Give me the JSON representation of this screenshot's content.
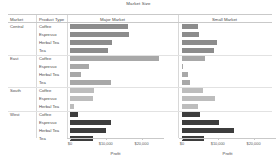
{
  "title": "Market Size",
  "headers": {
    "market": "Market",
    "product_type": "Product Type",
    "panels": [
      "Major Market",
      "Small Market"
    ]
  },
  "axis": {
    "label": "Profit",
    "ticks": [
      "$0",
      "$10,000",
      "$20,000"
    ],
    "tick_values": [
      0,
      10000,
      20000
    ],
    "min": 0,
    "max": 26000
  },
  "colors": {
    "Central": "#8c8c8c",
    "East": "#a8a8a8",
    "South": "#bdbdbd",
    "West": "#3d3d3d",
    "gridline": "#e2e2e2",
    "axis": "#c9c9c9",
    "text": "#4a4a4a"
  },
  "chart_data": {
    "type": "bar",
    "title": "Market Size",
    "xlabel": "Profit",
    "ylabel": "",
    "xlim": [
      0,
      26000
    ],
    "orientation": "horizontal",
    "grid": true,
    "legend_position": "none",
    "panel_columns": [
      "Major Market",
      "Small Market"
    ],
    "row_groups": [
      "Central",
      "East",
      "South",
      "West"
    ],
    "categories": [
      "Central - Coffee",
      "Central - Espresso",
      "Central - Herbal Tea",
      "Central - Tea",
      "East - Coffee",
      "East - Espresso",
      "East - Herbal Tea",
      "East - Tea",
      "South - Coffee",
      "South - Espresso",
      "South - Herbal Tea",
      "West - Coffee",
      "West - Espresso",
      "West - Herbal Tea",
      "West - Tea"
    ],
    "series": [
      {
        "name": "Major Market",
        "values": [
          16300,
          16600,
          11700,
          10600,
          24800,
          5300,
          3000,
          11500,
          6800,
          6300,
          1100,
          2200,
          11600,
          10200,
          6400
        ]
      },
      {
        "name": "Small Market",
        "values": [
          4600,
          4800,
          9700,
          8900,
          6300,
          200,
          1700,
          2300,
          5900,
          9300,
          4400,
          5100,
          10400,
          14600,
          6200
        ]
      }
    ],
    "rows": [
      {
        "market": "Central",
        "product_type": "Coffee",
        "major_market": 16300,
        "small_market": 4600
      },
      {
        "market": "Central",
        "product_type": "Espresso",
        "major_market": 16600,
        "small_market": 4800
      },
      {
        "market": "Central",
        "product_type": "Herbal Tea",
        "major_market": 11700,
        "small_market": 9700
      },
      {
        "market": "Central",
        "product_type": "Tea",
        "major_market": 10600,
        "small_market": 8900
      },
      {
        "market": "East",
        "product_type": "Coffee",
        "major_market": 24800,
        "small_market": 6300
      },
      {
        "market": "East",
        "product_type": "Espresso",
        "major_market": 5300,
        "small_market": 200
      },
      {
        "market": "East",
        "product_type": "Herbal Tea",
        "major_market": 3000,
        "small_market": 1700
      },
      {
        "market": "East",
        "product_type": "Tea",
        "major_market": 11500,
        "small_market": 2300
      },
      {
        "market": "South",
        "product_type": "Coffee",
        "major_market": 6800,
        "small_market": 5900
      },
      {
        "market": "South",
        "product_type": "Espresso",
        "major_market": 6300,
        "small_market": 9300
      },
      {
        "market": "South",
        "product_type": "Herbal Tea",
        "major_market": 1100,
        "small_market": 4400
      },
      {
        "market": "West",
        "product_type": "Coffee",
        "major_market": 2200,
        "small_market": 5100
      },
      {
        "market": "West",
        "product_type": "Espresso",
        "major_market": 11600,
        "small_market": 10400
      },
      {
        "market": "West",
        "product_type": "Herbal Tea",
        "major_market": 10200,
        "small_market": 14600
      },
      {
        "market": "West",
        "product_type": "Tea",
        "major_market": 6400,
        "small_market": 6200
      }
    ]
  }
}
